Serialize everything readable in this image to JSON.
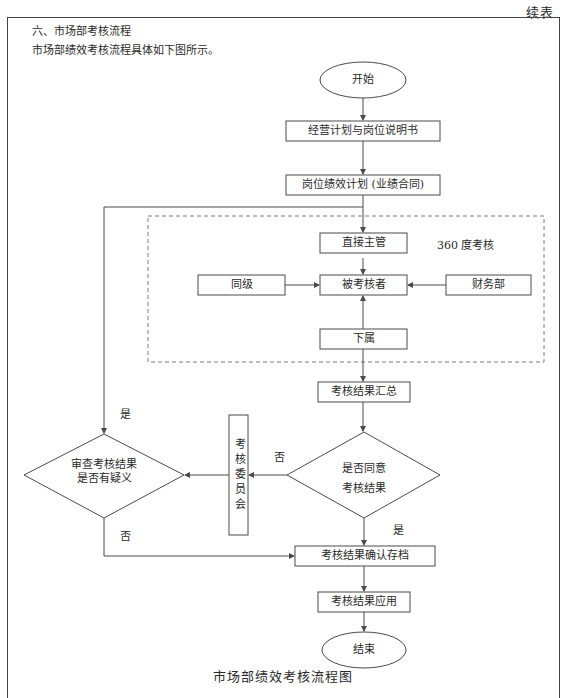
{
  "page": {
    "continued_label": "续表",
    "section_title": "六、市场部考核流程",
    "intro_text": "市场部绩效考核流程具体如下图所示。",
    "figure_caption": "市场部绩效考核流程图"
  },
  "flowchart": {
    "nodes": {
      "start": "开始",
      "business_plan": "经营计划与岗位说明书",
      "performance_plan": "岗位绩效计划 (业绩合同)",
      "direct_supervisor": "直接主管",
      "peer": "同级",
      "appraisee": "被考核者",
      "finance": "财务部",
      "subordinate": "下属",
      "summary": "考核结果汇总",
      "agree_decision_line1": "是否同意",
      "agree_decision_line2": "考核结果",
      "committee": "考核委员会",
      "review_decision_line1": "审查考核结果",
      "review_decision_line2": "是否有疑义",
      "archive": "考核结果确认存档",
      "apply": "考核结果应用",
      "end": "结束"
    },
    "group_label": "360  度考核",
    "edge_labels": {
      "review_yes": "是",
      "agree_no": "否",
      "review_no": "否",
      "agree_yes": "是"
    },
    "colors": {
      "line": "#4a4a4a",
      "dashed_group": "#7a7a7a"
    }
  }
}
